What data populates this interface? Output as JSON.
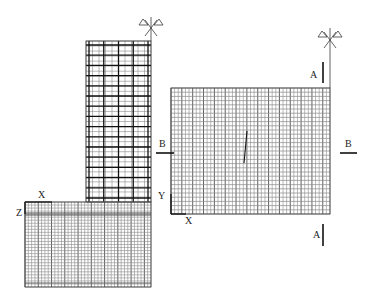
{
  "figure": {
    "type": "finite-element-mesh-diagram",
    "colors": {
      "line": "#3a3a3a",
      "heavy": "#111111",
      "light": "#8a8a8a",
      "background": "#ffffff"
    }
  },
  "labels": {
    "left_x": "X",
    "left_z": "Z",
    "right_x": "X",
    "right_y": "Y",
    "section_a_top": "A",
    "section_a_bottom": "A",
    "section_b_left": "B",
    "section_b_right": "B"
  },
  "meshes": {
    "column": {
      "x": 86,
      "y": 41,
      "w": 65,
      "h": 161,
      "heavy_cols": 5,
      "heavy_rows": 16,
      "sub_cols": 10,
      "sub_rows": 32
    },
    "base": {
      "x": 25,
      "y": 202,
      "w": 126,
      "h": 85,
      "cols": 38,
      "rows": 28,
      "band_y": 214
    },
    "right": {
      "x": 171,
      "y": 88,
      "w": 159,
      "h": 126,
      "cols": 44,
      "rows": 30
    }
  },
  "symbols": [
    {
      "name": "anchor-symbol-left",
      "x": 151,
      "y": 28,
      "mast_top": 17,
      "mast_bottom": 41
    },
    {
      "name": "anchor-symbol-right",
      "x": 330,
      "y": 40,
      "mast_top": 28,
      "mast_bottom": 88
    }
  ],
  "section_marks": {
    "a_top": {
      "x": 323,
      "y1": 62,
      "y2": 83
    },
    "a_bottom": {
      "x": 323,
      "y1": 224,
      "y2": 246
    },
    "b_left": {
      "x1": 156,
      "x2": 174,
      "y": 153
    },
    "b_right": {
      "x1": 340,
      "x2": 357,
      "y": 153
    }
  }
}
